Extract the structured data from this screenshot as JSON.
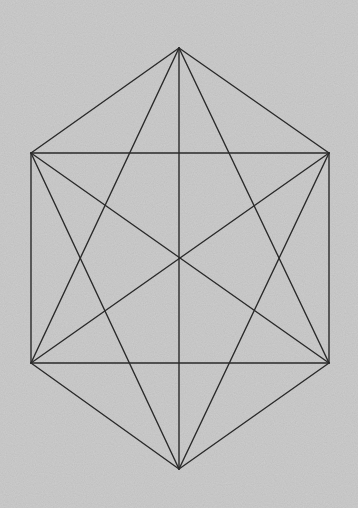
{
  "figure": {
    "width": 358,
    "height": 508,
    "background_color": "#c9c9c9",
    "line_color": "#2a2a2a",
    "line_width": 1.4,
    "vertices": {
      "top": [
        179,
        48
      ],
      "upper_left": [
        31,
        153
      ],
      "upper_right": [
        329,
        153
      ],
      "lower_left": [
        31,
        363
      ],
      "lower_right": [
        329,
        363
      ],
      "bottom": [
        179,
        469
      ],
      "center": [
        179,
        258
      ]
    },
    "segments": [
      {
        "name": "hexagon-edge-top-upper-right",
        "from": "top",
        "to": "upper_right"
      },
      {
        "name": "hexagon-edge-upper-right-lower-right",
        "from": "upper_right",
        "to": "lower_right"
      },
      {
        "name": "hexagon-edge-lower-right-bottom",
        "from": "lower_right",
        "to": "bottom"
      },
      {
        "name": "hexagon-edge-bottom-lower-left",
        "from": "bottom",
        "to": "lower_left"
      },
      {
        "name": "hexagon-edge-lower-left-upper-left",
        "from": "lower_left",
        "to": "upper_left"
      },
      {
        "name": "hexagon-edge-upper-left-top",
        "from": "upper_left",
        "to": "top"
      },
      {
        "name": "horizontal-chord-upper",
        "from": "upper_left",
        "to": "upper_right"
      },
      {
        "name": "horizontal-chord-lower",
        "from": "lower_left",
        "to": "lower_right"
      },
      {
        "name": "vertical-diagonal",
        "from": "top",
        "to": "bottom"
      },
      {
        "name": "diagonal-upper-left-lower-right",
        "from": "upper_left",
        "to": "lower_right"
      },
      {
        "name": "diagonal-upper-right-lower-left",
        "from": "upper_right",
        "to": "lower_left"
      },
      {
        "name": "triangle-up-left-edge",
        "from": "top",
        "to": "lower_left"
      },
      {
        "name": "triangle-up-right-edge",
        "from": "top",
        "to": "lower_right"
      },
      {
        "name": "triangle-down-left-edge",
        "from": "bottom",
        "to": "upper_left"
      },
      {
        "name": "triangle-down-right-edge",
        "from": "bottom",
        "to": "upper_right"
      }
    ]
  }
}
